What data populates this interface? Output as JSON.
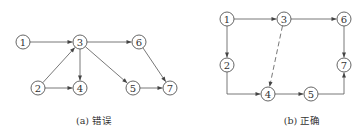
{
  "diagrams": [
    {
      "id": "a",
      "caption": "(a) 错误",
      "nodes": [
        {
          "id": "1",
          "label": "1"
        },
        {
          "id": "2",
          "label": "2"
        },
        {
          "id": "3",
          "label": "3"
        },
        {
          "id": "4",
          "label": "4"
        },
        {
          "id": "5",
          "label": "5"
        },
        {
          "id": "6",
          "label": "6"
        },
        {
          "id": "7",
          "label": "7"
        }
      ],
      "edges": [
        {
          "from": "1",
          "to": "3",
          "style": "solid"
        },
        {
          "from": "2",
          "to": "3",
          "style": "solid"
        },
        {
          "from": "2",
          "to": "4",
          "style": "solid"
        },
        {
          "from": "3",
          "to": "4",
          "style": "solid"
        },
        {
          "from": "3",
          "to": "5",
          "style": "solid"
        },
        {
          "from": "3",
          "to": "6",
          "style": "solid"
        },
        {
          "from": "5",
          "to": "7",
          "style": "solid"
        },
        {
          "from": "6",
          "to": "7",
          "style": "solid"
        }
      ]
    },
    {
      "id": "b",
      "caption": "(b) 正确",
      "nodes": [
        {
          "id": "1",
          "label": "1"
        },
        {
          "id": "2",
          "label": "2"
        },
        {
          "id": "3",
          "label": "3"
        },
        {
          "id": "4",
          "label": "4"
        },
        {
          "id": "5",
          "label": "5"
        },
        {
          "id": "6",
          "label": "6"
        },
        {
          "id": "7",
          "label": "7"
        }
      ],
      "edges": [
        {
          "from": "1",
          "to": "3",
          "style": "solid"
        },
        {
          "from": "1",
          "to": "2",
          "style": "solid"
        },
        {
          "from": "3",
          "to": "6",
          "style": "solid"
        },
        {
          "from": "3",
          "to": "4",
          "style": "dashed"
        },
        {
          "from": "2",
          "to": "4",
          "style": "solid"
        },
        {
          "from": "4",
          "to": "5",
          "style": "solid"
        },
        {
          "from": "5",
          "to": "7",
          "style": "solid"
        },
        {
          "from": "6",
          "to": "7",
          "style": "solid"
        }
      ]
    }
  ]
}
